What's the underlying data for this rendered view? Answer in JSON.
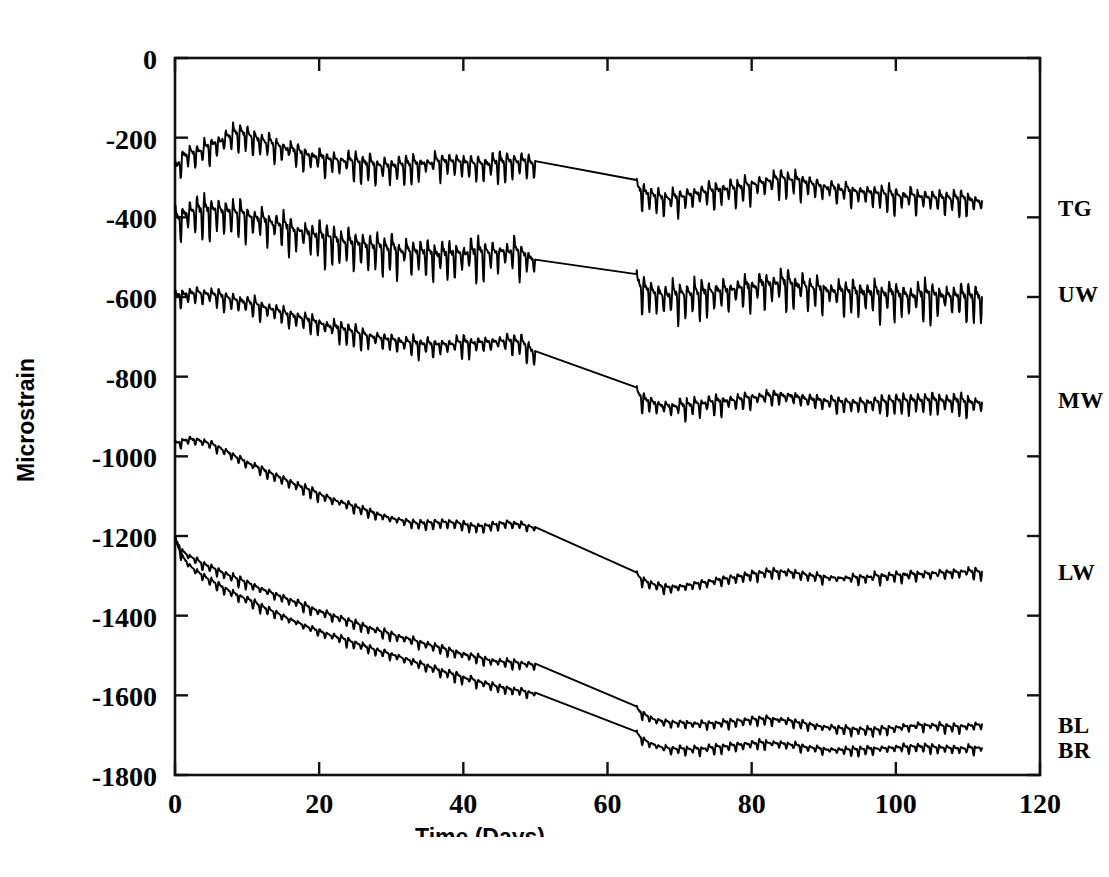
{
  "figure": {
    "background_color": "#ffffff",
    "line_color": "#000000"
  },
  "chart_data": {
    "type": "line",
    "title": "",
    "xlabel": "Time (Days)",
    "ylabel": "Microstrain",
    "xlim": [
      0,
      120
    ],
    "ylim": [
      -1800,
      0
    ],
    "xticks": [
      0,
      20,
      40,
      60,
      80,
      100,
      120
    ],
    "xtick_labels": [
      "0",
      "20",
      "40",
      "60",
      "80",
      "100",
      "120"
    ],
    "yticks": [
      0,
      -200,
      -400,
      -600,
      -800,
      -1000,
      -1200,
      -1400,
      -1600,
      -1800
    ],
    "ytick_labels": [
      "0",
      "-200",
      "-400",
      "-600",
      "-800",
      "-1000",
      "-1200",
      "-1400",
      "-1600",
      "-1800"
    ],
    "grid": false,
    "legend_position": "right-inline-labels",
    "data_gap": {
      "start_day": 50,
      "end_day": 64,
      "description": "straight interpolation segment between the two recording periods"
    },
    "series": [
      {
        "name": "TG",
        "label": "TG",
        "label_day": 114,
        "label_value": -375,
        "oscillation_amplitude": 28,
        "segment_1": {
          "x": [
            0,
            1,
            2,
            3,
            4,
            5,
            6,
            7,
            8,
            9,
            10,
            12,
            14,
            16,
            18,
            20,
            22,
            24,
            26,
            28,
            30,
            32,
            34,
            36,
            38,
            40,
            42,
            44,
            46,
            48,
            50
          ],
          "y": [
            -290,
            -250,
            -243,
            -238,
            -232,
            -222,
            -215,
            -205,
            -195,
            -190,
            -198,
            -212,
            -222,
            -232,
            -244,
            -254,
            -258,
            -262,
            -268,
            -272,
            -276,
            -273,
            -268,
            -264,
            -262,
            -266,
            -270,
            -268,
            -264,
            -262,
            -268
          ]
        },
        "segment_2": {
          "x": [
            64,
            65,
            66,
            67,
            68,
            70,
            72,
            74,
            76,
            78,
            80,
            82,
            84,
            86,
            88,
            90,
            92,
            94,
            96,
            98,
            100,
            102,
            104,
            106,
            108,
            110,
            112
          ],
          "y": [
            -330,
            -340,
            -348,
            -352,
            -356,
            -352,
            -344,
            -338,
            -334,
            -330,
            -322,
            -312,
            -306,
            -310,
            -318,
            -326,
            -332,
            -336,
            -340,
            -344,
            -348,
            -350,
            -352,
            -354,
            -356,
            -358,
            -362
          ]
        }
      },
      {
        "name": "UW",
        "label": "UW",
        "label_day": 114,
        "label_value": -590,
        "oscillation_amplitude": 40,
        "segment_1": {
          "x": [
            0,
            1,
            2,
            3,
            4,
            5,
            6,
            7,
            8,
            9,
            10,
            12,
            14,
            16,
            18,
            20,
            22,
            24,
            26,
            28,
            30,
            32,
            34,
            36,
            38,
            40,
            42,
            44,
            46,
            48,
            50
          ],
          "y": [
            -412,
            -398,
            -392,
            -390,
            -388,
            -386,
            -388,
            -390,
            -392,
            -396,
            -400,
            -410,
            -420,
            -432,
            -442,
            -452,
            -460,
            -468,
            -474,
            -480,
            -484,
            -488,
            -492,
            -496,
            -498,
            -496,
            -494,
            -492,
            -490,
            -492,
            -512
          ]
        },
        "segment_2": {
          "x": [
            64,
            65,
            66,
            67,
            68,
            70,
            72,
            74,
            76,
            78,
            80,
            82,
            84,
            86,
            88,
            90,
            92,
            94,
            96,
            98,
            100,
            102,
            104,
            106,
            108,
            110,
            112
          ],
          "y": [
            -572,
            -582,
            -590,
            -596,
            -600,
            -600,
            -596,
            -592,
            -588,
            -584,
            -578,
            -572,
            -570,
            -574,
            -580,
            -586,
            -590,
            -592,
            -594,
            -596,
            -598,
            -600,
            -600,
            -600,
            -602,
            -604,
            -606
          ]
        }
      },
      {
        "name": "MW",
        "label": "MW",
        "label_day": 114,
        "label_value": -855,
        "oscillation_amplitude": 22,
        "segment_1": {
          "x": [
            0,
            1,
            2,
            3,
            4,
            5,
            6,
            7,
            8,
            9,
            10,
            12,
            14,
            16,
            18,
            20,
            22,
            24,
            26,
            28,
            30,
            32,
            34,
            36,
            38,
            40,
            42,
            44,
            46,
            48,
            50
          ],
          "y": [
            -602,
            -596,
            -594,
            -592,
            -594,
            -596,
            -600,
            -604,
            -608,
            -612,
            -616,
            -626,
            -636,
            -648,
            -658,
            -668,
            -678,
            -688,
            -696,
            -704,
            -710,
            -716,
            -720,
            -722,
            -720,
            -718,
            -716,
            -714,
            -712,
            -716,
            -745
          ]
        },
        "segment_2": {
          "x": [
            64,
            65,
            66,
            67,
            68,
            70,
            72,
            74,
            76,
            78,
            80,
            82,
            84,
            86,
            88,
            90,
            92,
            94,
            96,
            98,
            100,
            102,
            104,
            106,
            108,
            110,
            112
          ],
          "y": [
            -845,
            -858,
            -866,
            -872,
            -876,
            -876,
            -872,
            -868,
            -864,
            -860,
            -854,
            -850,
            -848,
            -852,
            -858,
            -862,
            -866,
            -868,
            -868,
            -866,
            -864,
            -862,
            -862,
            -862,
            -864,
            -866,
            -868
          ]
        }
      },
      {
        "name": "LW",
        "label": "LW",
        "label_day": 114,
        "label_value": -1288,
        "oscillation_amplitude": 12,
        "segment_1": {
          "x": [
            0,
            1,
            2,
            3,
            4,
            5,
            6,
            7,
            8,
            9,
            10,
            12,
            14,
            16,
            18,
            20,
            22,
            24,
            26,
            28,
            30,
            32,
            34,
            36,
            38,
            40,
            42,
            44,
            46,
            48,
            50
          ],
          "y": [
            -972,
            -962,
            -958,
            -960,
            -964,
            -970,
            -978,
            -988,
            -998,
            -1008,
            -1016,
            -1034,
            -1050,
            -1066,
            -1082,
            -1096,
            -1110,
            -1122,
            -1134,
            -1146,
            -1156,
            -1164,
            -1170,
            -1168,
            -1166,
            -1172,
            -1178,
            -1174,
            -1168,
            -1172,
            -1180
          ]
        },
        "segment_2": {
          "x": [
            64,
            65,
            66,
            67,
            68,
            70,
            72,
            74,
            76,
            78,
            80,
            82,
            84,
            86,
            88,
            90,
            92,
            94,
            96,
            98,
            100,
            102,
            104,
            106,
            108,
            110,
            112
          ],
          "y": [
            -1300,
            -1312,
            -1320,
            -1326,
            -1330,
            -1328,
            -1322,
            -1316,
            -1310,
            -1304,
            -1298,
            -1292,
            -1290,
            -1294,
            -1300,
            -1304,
            -1306,
            -1306,
            -1304,
            -1302,
            -1300,
            -1298,
            -1296,
            -1294,
            -1292,
            -1290,
            -1292
          ]
        }
      },
      {
        "name": "BL",
        "label": "BL",
        "label_day": 114,
        "label_value": -1672,
        "oscillation_amplitude": 10,
        "segment_1": {
          "x": [
            0,
            1,
            2,
            3,
            4,
            5,
            6,
            7,
            8,
            9,
            10,
            12,
            14,
            16,
            18,
            20,
            22,
            24,
            26,
            28,
            30,
            32,
            34,
            36,
            38,
            40,
            42,
            44,
            46,
            48,
            50
          ],
          "y": [
            -1210,
            -1238,
            -1252,
            -1262,
            -1272,
            -1280,
            -1288,
            -1296,
            -1304,
            -1312,
            -1318,
            -1334,
            -1348,
            -1362,
            -1376,
            -1390,
            -1402,
            -1414,
            -1426,
            -1438,
            -1448,
            -1458,
            -1468,
            -1478,
            -1488,
            -1498,
            -1506,
            -1514,
            -1518,
            -1520,
            -1525
          ]
        },
        "segment_2": {
          "x": [
            64,
            65,
            66,
            67,
            68,
            70,
            72,
            74,
            76,
            78,
            80,
            82,
            84,
            86,
            88,
            90,
            92,
            94,
            96,
            98,
            100,
            102,
            104,
            106,
            108,
            110,
            112
          ],
          "y": [
            -1636,
            -1648,
            -1658,
            -1664,
            -1668,
            -1670,
            -1672,
            -1672,
            -1670,
            -1666,
            -1662,
            -1660,
            -1662,
            -1668,
            -1674,
            -1680,
            -1684,
            -1686,
            -1688,
            -1686,
            -1682,
            -1678,
            -1676,
            -1678,
            -1680,
            -1678,
            -1674
          ]
        }
      },
      {
        "name": "BR",
        "label": "BR",
        "label_day": 114,
        "label_value": -1735,
        "oscillation_amplitude": 10,
        "segment_1": {
          "x": [
            0,
            1,
            2,
            3,
            4,
            5,
            6,
            7,
            8,
            9,
            10,
            12,
            14,
            16,
            18,
            20,
            22,
            24,
            26,
            28,
            30,
            32,
            34,
            36,
            38,
            40,
            42,
            44,
            46,
            48,
            50
          ],
          "y": [
            -1212,
            -1252,
            -1274,
            -1290,
            -1302,
            -1314,
            -1324,
            -1334,
            -1344,
            -1352,
            -1360,
            -1378,
            -1394,
            -1410,
            -1426,
            -1440,
            -1452,
            -1464,
            -1476,
            -1488,
            -1498,
            -1510,
            -1522,
            -1534,
            -1546,
            -1556,
            -1566,
            -1576,
            -1584,
            -1590,
            -1596
          ]
        },
        "segment_2": {
          "x": [
            64,
            65,
            66,
            67,
            68,
            70,
            72,
            74,
            76,
            78,
            80,
            82,
            84,
            86,
            88,
            90,
            92,
            94,
            96,
            98,
            100,
            102,
            104,
            106,
            108,
            110,
            112
          ],
          "y": [
            -1698,
            -1712,
            -1722,
            -1728,
            -1734,
            -1736,
            -1736,
            -1734,
            -1730,
            -1726,
            -1722,
            -1720,
            -1722,
            -1726,
            -1732,
            -1736,
            -1738,
            -1738,
            -1736,
            -1734,
            -1732,
            -1730,
            -1730,
            -1732,
            -1734,
            -1734,
            -1732
          ]
        }
      }
    ]
  }
}
